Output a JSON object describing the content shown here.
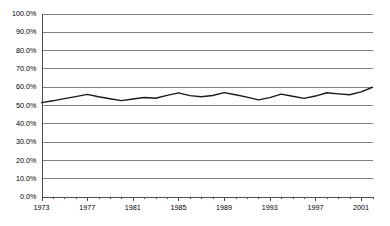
{
  "chart_data": {
    "type": "line",
    "title": "",
    "subtitle": "",
    "xlabel": "",
    "ylabel": "",
    "ylim": [
      0,
      1.0
    ],
    "xlim": [
      1973,
      2002
    ],
    "grid": true,
    "legend": false,
    "legend_position": "none",
    "y_tick_labels": [
      "100.0%",
      "90.0%",
      "80.0%",
      "70.0%",
      "60.0%",
      "50.0%",
      "40.0%",
      "30.0%",
      "20.0%",
      "10.0%",
      "0.0%"
    ],
    "y_tick_values": [
      1.0,
      0.9,
      0.8,
      0.7,
      0.6,
      0.5,
      0.4,
      0.3,
      0.2,
      0.1,
      0.0
    ],
    "x_tick_labels": [
      "1973",
      "1977",
      "1981",
      "1985",
      "1989",
      "1993",
      "1997",
      "2001"
    ],
    "x_tick_values": [
      1973,
      1977,
      1981,
      1985,
      1989,
      1993,
      1997,
      2001
    ],
    "x_minor_ticks": [
      1973,
      1974,
      1975,
      1976,
      1977,
      1978,
      1979,
      1980,
      1981,
      1982,
      1983,
      1984,
      1985,
      1986,
      1987,
      1988,
      1989,
      1990,
      1991,
      1992,
      1993,
      1994,
      1995,
      1996,
      1997,
      1998,
      1999,
      2000,
      2001,
      2002
    ],
    "series": [
      {
        "name": "Series 1",
        "color": "#1a1a1a",
        "x": [
          1973,
          1974,
          1975,
          1976,
          1977,
          1978,
          1979,
          1980,
          1981,
          1982,
          1983,
          1984,
          1985,
          1986,
          1987,
          1988,
          1989,
          1990,
          1991,
          1992,
          1993,
          1994,
          1995,
          1996,
          1997,
          1998,
          1999,
          2000,
          2001,
          2002
        ],
        "values": [
          0.513,
          0.523,
          0.535,
          0.546,
          0.558,
          0.545,
          0.534,
          0.524,
          0.533,
          0.541,
          0.537,
          0.553,
          0.566,
          0.551,
          0.545,
          0.552,
          0.568,
          0.556,
          0.543,
          0.528,
          0.54,
          0.559,
          0.548,
          0.536,
          0.549,
          0.567,
          0.561,
          0.556,
          0.572,
          0.597
        ]
      }
    ]
  },
  "axes": {
    "y_axis_name": "percent-axis",
    "x_axis_name": "year-axis"
  }
}
